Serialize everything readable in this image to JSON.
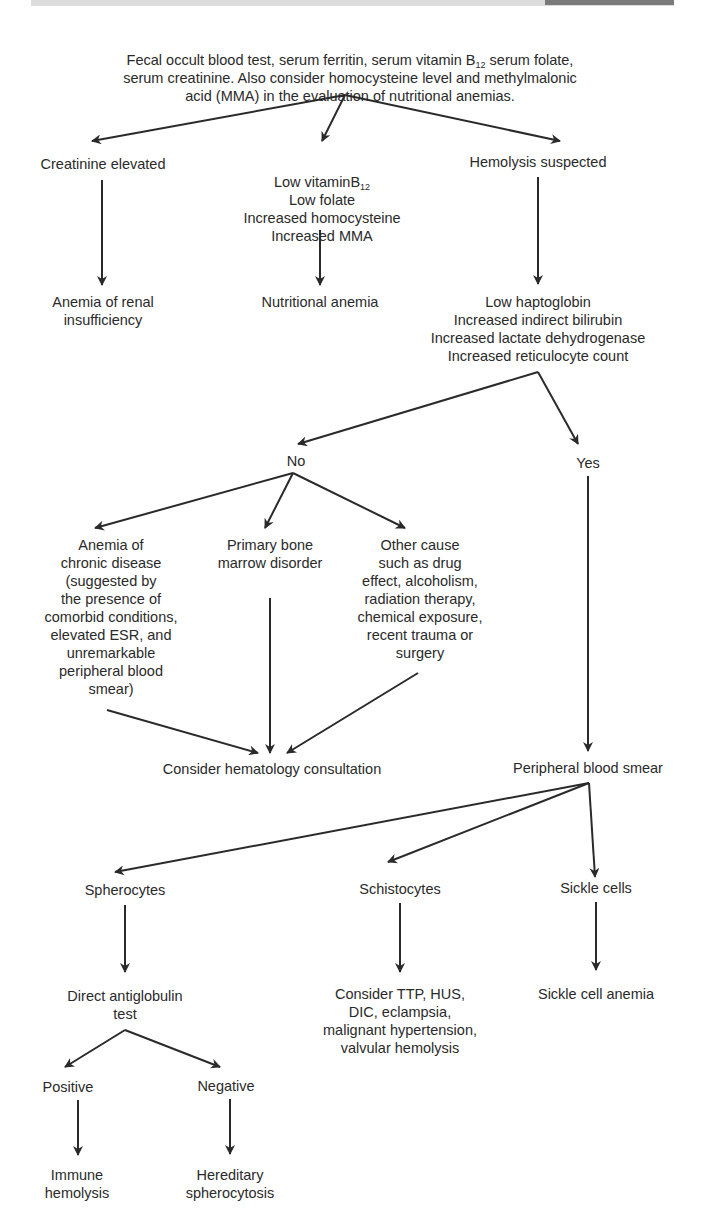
{
  "header_bar": {
    "visible": true
  },
  "nodes": {
    "start": {
      "line1_pre": "Fecal occult blood test, serum ferritin, serum vitamin B",
      "line1_sub": "12",
      "line1_post": " serum folate,",
      "rest": "serum creatinine.  Also consider homocysteine level and methylmalonic\nacid (MMA) in the evaluation of nutritional anemias."
    },
    "creatinine_elevated": "Creatinine elevated",
    "low_b12_pre": "Low vitaminB",
    "low_b12_sub": "12",
    "low_b12_rest": "Low folate\nIncreased homocysteine\nIncreased MMA",
    "hemolysis_suspected": "Hemolysis suspected",
    "anemia_renal": "Anemia of renal\ninsufficiency",
    "nutritional_anemia": "Nutritional anemia",
    "hemolysis_labs": "Low haptoglobin\nIncreased indirect bilirubin\nIncreased lactate dehydrogenase\nIncreased reticulocyte count",
    "no": "No",
    "yes": "Yes",
    "anemia_chronic": "Anemia of\nchronic disease\n(suggested by\nthe presence of\ncomorbid conditions,\nelevated ESR, and\nunremarkable\nperipheral blood\nsmear)",
    "primary_marrow": "Primary bone\nmarrow disorder",
    "other_cause": "Other cause\nsuch as drug\neffect, alcoholism,\nradiation therapy,\nchemical exposure,\nrecent trauma or\nsurgery",
    "hematology_consult": "Consider hematology consultation",
    "peripheral_smear": "Peripheral blood smear",
    "spherocytes": "Spherocytes",
    "schistocytes": "Schistocytes",
    "sickle_cells": "Sickle cells",
    "direct_antiglobulin": "Direct antiglobulin\ntest",
    "consider_ttp": "Consider TTP, HUS,\nDIC, eclampsia,\nmalignant hypertension,\nvalvular hemolysis",
    "sickle_cell_anemia": "Sickle cell anemia",
    "positive": "Positive",
    "negative": "Negative",
    "immune_hemolysis": "Immune\nhemolysis",
    "hereditary_spherocytosis": "Hereditary\nspherocytosis"
  },
  "colors": {
    "line": "#2a2a2a",
    "text": "#2a2a2a",
    "header_bar": "#dcdcdc",
    "header_bar_dark": "#7a7a7a"
  }
}
